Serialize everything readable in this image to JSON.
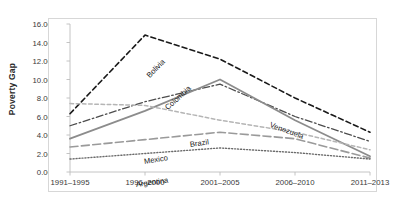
{
  "chart_data": {
    "type": "line",
    "title": "",
    "xlabel": "",
    "ylabel": "Poverty Gap",
    "ylim": [
      0.0,
      16.0
    ],
    "ytick_values": [
      0.0,
      2.0,
      4.0,
      6.0,
      8.0,
      10.0,
      12.0,
      14.0,
      16.0
    ],
    "ytick_labels": [
      "0.00",
      "2.00",
      "4.00",
      "6.00",
      "8.00",
      "10.00",
      "12.00",
      "14.00",
      "16.00"
    ],
    "categories": [
      "1991–1995",
      "1996–2000",
      "2001–2005",
      "2006–2010",
      "2011–2013"
    ],
    "grid": false,
    "legend": "inline-labels",
    "series": [
      {
        "name": "Bolivia",
        "values": [
          6.3,
          14.8,
          12.2,
          8.0,
          4.3
        ],
        "style": "dashed",
        "color": "#1a1a1a",
        "width": 1.6
      },
      {
        "name": "Colombia",
        "values": [
          5.0,
          7.6,
          9.5,
          6.0,
          3.3
        ],
        "style": "dash-dot",
        "color": "#4d4d4d",
        "width": 1.3
      },
      {
        "name": "Venezuela",
        "values": [
          3.6,
          6.6,
          10.0,
          5.6,
          1.7
        ],
        "style": "solid",
        "color": "#8c8c8c",
        "width": 1.8
      },
      {
        "name": "Brazil",
        "values": [
          7.4,
          7.2,
          5.6,
          4.3,
          2.4
        ],
        "style": "short-dash",
        "color": "#b5b5b5",
        "width": 1.5
      },
      {
        "name": "Mexico",
        "values": [
          2.7,
          3.5,
          4.3,
          3.6,
          1.5
        ],
        "style": "long-dash",
        "color": "#9a9a9a",
        "width": 1.6
      },
      {
        "name": "Argentina",
        "values": [
          1.4,
          2.0,
          2.6,
          2.1,
          1.4
        ],
        "style": "dotted",
        "color": "#6b6b6b",
        "width": 1.4
      }
    ],
    "inline_labels": [
      {
        "name": "Bolivia",
        "x": 78,
        "y": 48,
        "rotate": -46
      },
      {
        "name": "Colombia",
        "x": 96,
        "y": 80,
        "rotate": -42
      },
      {
        "name": "Venezuela",
        "x": 200,
        "y": 96,
        "rotate": 20
      },
      {
        "name": "Brazil",
        "x": 120,
        "y": 116,
        "rotate": -8
      },
      {
        "name": "Mexico",
        "x": 74,
        "y": 133,
        "rotate": -9
      },
      {
        "name": "Argentina",
        "x": 66,
        "y": 156,
        "rotate": -8
      }
    ]
  }
}
